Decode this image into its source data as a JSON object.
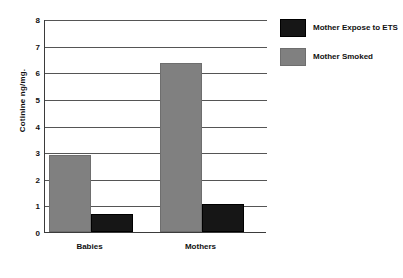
{
  "chart_data": {
    "type": "bar",
    "title": "",
    "xlabel": "",
    "ylabel": "Cotinine ng/mg.",
    "categories": [
      "Babies",
      "Mothers"
    ],
    "series": [
      {
        "name": "Mother Expose to ETS",
        "color": "#161616",
        "values": [
          0.68,
          1.07
        ]
      },
      {
        "name": "Mother Smoked",
        "color": "#808080",
        "values": [
          2.9,
          6.35
        ]
      }
    ],
    "ylim": [
      0,
      8
    ],
    "ytick_step": 1,
    "ytick_labels": [
      "8",
      "7",
      "6",
      "5",
      "4",
      "3",
      "2",
      "1",
      "0"
    ],
    "grid": true,
    "grid_axis": "y",
    "legend_position": "right",
    "draw_order": [
      "Mother Smoked",
      "Mother Expose to ETS"
    ]
  },
  "axis": {
    "y_title": "Cotinine ng/mg."
  },
  "legend": {
    "items": [
      {
        "label": "Mother Expose to ETS",
        "swatch": "black-swatch"
      },
      {
        "label": "Mother Smoked",
        "swatch": "gray-swatch"
      }
    ]
  }
}
